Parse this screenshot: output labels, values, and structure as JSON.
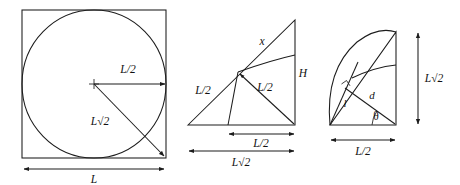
{
  "figure": {
    "kind": "geometry-diagram",
    "panel_count": 3,
    "stroke_color": "#1c1c1c",
    "background_color": "#ffffff",
    "label_color": "#111111"
  },
  "panel_left": {
    "name": "square-with-inscribed-circle",
    "labels": {
      "radius": "L/2",
      "half_diagonal": "L√2",
      "side": "L"
    }
  },
  "panel_middle": {
    "name": "right-triangle-with-arcs",
    "labels": {
      "hypotenuse_segment": "x",
      "left_leg_segment": "L/2",
      "arrow_segment": "L/2",
      "height": "H",
      "base_inner": "L/2",
      "base_outer": "L√2"
    }
  },
  "panel_right": {
    "name": "triangle-with-angle-and-chord",
    "labels": {
      "vertical": "L√2",
      "base": "L/2",
      "chord": "l",
      "distance": "d",
      "angle": "θ"
    }
  }
}
